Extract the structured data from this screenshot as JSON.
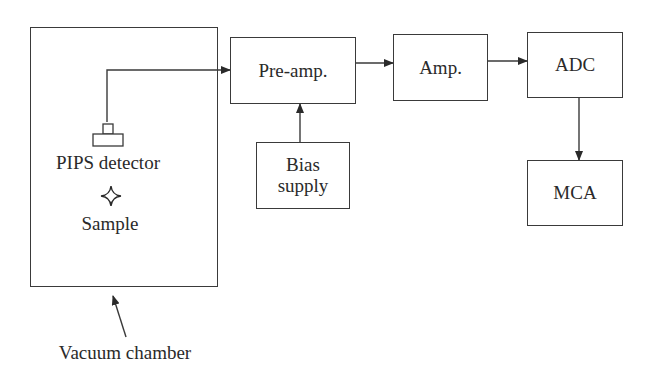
{
  "diagram": {
    "type": "block-diagram",
    "nodes": {
      "vacuum_chamber": {
        "label": "Vacuum chamber"
      },
      "detector": {
        "label": "PIPS detector"
      },
      "sample": {
        "label": "Sample",
        "icon": "four-point-star-icon"
      },
      "preamp": {
        "label": "Pre-amp."
      },
      "amp": {
        "label": "Amp."
      },
      "adc": {
        "label": "ADC"
      },
      "mca": {
        "label": "MCA"
      },
      "bias": {
        "label_line1": "Bias",
        "label_line2": "supply"
      }
    },
    "edges": [
      {
        "from": "PIPS detector",
        "to": "Pre-amp."
      },
      {
        "from": "Bias supply",
        "to": "Pre-amp."
      },
      {
        "from": "Pre-amp.",
        "to": "Amp."
      },
      {
        "from": "Amp.",
        "to": "ADC"
      },
      {
        "from": "ADC",
        "to": "MCA"
      },
      {
        "from": "Vacuum chamber label",
        "to": "Vacuum chamber"
      }
    ],
    "colors": {
      "stroke": "#3a3a3a",
      "background": "#ffffff",
      "text": "#2a2a2a"
    }
  }
}
